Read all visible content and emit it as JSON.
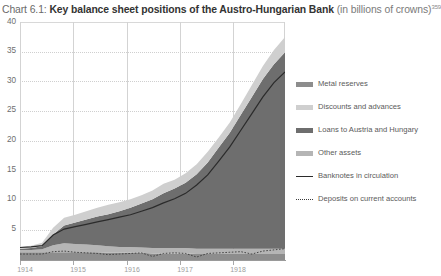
{
  "title": {
    "chart_number": "Chart 6.1:",
    "main": "Key balance sheet positions of the Austro-Hungarian Bank",
    "unit": "(in billions of crowns)",
    "footnote_marker": "359"
  },
  "legend": {
    "position": "right",
    "items": [
      {
        "label": "Metal reserves",
        "style": "area",
        "color": "#8d8d8d"
      },
      {
        "label": "Discounts and advances",
        "style": "area",
        "color": "#cfcfcf"
      },
      {
        "label": "Loans to Austria and Hungary",
        "style": "area",
        "color": "#6e6e6e"
      },
      {
        "label": "Other assets",
        "style": "area",
        "color": "#b5b5b5"
      },
      {
        "label": "Banknotes in circulation",
        "style": "line",
        "color": "#2b2b2b"
      },
      {
        "label": "Deposits on current accounts",
        "style": "dotted",
        "color": "#3a3a3a"
      }
    ]
  },
  "axes": {
    "y_ticks": [
      "5",
      "10",
      "15",
      "20",
      "25",
      "30",
      "35",
      "40"
    ],
    "x_ticks": [
      "1914",
      "1915",
      "1916",
      "1917",
      "1918"
    ]
  },
  "chart_data": {
    "type": "area",
    "title": "Key balance sheet positions of the Austro-Hungarian Bank (in billions of crowns)",
    "xlabel": "",
    "ylabel": "billions of crowns",
    "ylim": [
      0,
      40
    ],
    "grid": true,
    "legend_position": "right",
    "stacked": true,
    "x": [
      "1914",
      "1914.2",
      "1914.4",
      "1914.6",
      "1914.8",
      "1915",
      "1915.2",
      "1915.4",
      "1915.6",
      "1915.8",
      "1916",
      "1916.2",
      "1916.4",
      "1916.6",
      "1916.8",
      "1917",
      "1917.2",
      "1917.4",
      "1917.6",
      "1917.8",
      "1918",
      "1918.2",
      "1918.4",
      "1918.6",
      "1918.8"
    ],
    "x_tick_labels": [
      "1914",
      "1915",
      "1916",
      "1917",
      "1918"
    ],
    "series": [
      {
        "name": "Metal reserves",
        "color": "#8d8d8d",
        "values": [
          1.3,
          1.3,
          1.3,
          1.3,
          1.3,
          1.3,
          1.3,
          1.3,
          1.2,
          1.2,
          1.2,
          1.2,
          1.1,
          1.1,
          1.1,
          1.1,
          1.0,
          1.0,
          1.0,
          1.0,
          1.0,
          1.0,
          1.0,
          1.0,
          1.0
        ]
      },
      {
        "name": "Other assets",
        "color": "#b5b5b5",
        "values": [
          0.4,
          0.4,
          0.5,
          1.2,
          1.5,
          1.4,
          1.3,
          1.2,
          1.1,
          1.0,
          1.0,
          0.9,
          0.9,
          0.9,
          0.9,
          0.9,
          0.9,
          0.9,
          0.9,
          0.9,
          0.9,
          0.9,
          0.9,
          0.9,
          0.9
        ]
      },
      {
        "name": "Loans to Austria and Hungary",
        "color": "#6e6e6e",
        "values": [
          0.2,
          0.3,
          0.5,
          1.8,
          3.0,
          3.6,
          4.2,
          4.8,
          5.4,
          6.0,
          6.6,
          7.4,
          8.2,
          9.2,
          10.0,
          11.0,
          12.5,
          14.5,
          17.0,
          19.5,
          22.5,
          25.5,
          28.5,
          31.0,
          33.0
        ]
      },
      {
        "name": "Discounts and advances",
        "color": "#cfcfcf",
        "values": [
          0.3,
          0.4,
          0.6,
          1.1,
          1.3,
          1.3,
          1.4,
          1.5,
          1.6,
          1.5,
          1.4,
          1.4,
          1.5,
          1.6,
          1.5,
          1.6,
          1.7,
          1.8,
          1.7,
          1.7,
          1.8,
          2.0,
          2.2,
          2.4,
          2.6
        ]
      }
    ],
    "lines": [
      {
        "name": "Banknotes in circulation",
        "color": "#2b2b2b",
        "style": "solid",
        "values": [
          2.1,
          2.2,
          2.4,
          4.2,
          5.2,
          5.6,
          6.0,
          6.4,
          6.8,
          7.2,
          7.6,
          8.2,
          8.8,
          9.6,
          10.3,
          11.2,
          12.6,
          14.3,
          16.6,
          19.0,
          21.8,
          24.6,
          27.4,
          29.8,
          31.6
        ]
      },
      {
        "name": "Deposits on current accounts",
        "color": "#3a3a3a",
        "style": "dotted",
        "values": [
          1.0,
          1.0,
          1.0,
          1.4,
          1.5,
          1.3,
          1.2,
          1.1,
          0.9,
          1.0,
          1.1,
          1.2,
          0.6,
          1.1,
          1.2,
          1.1,
          0.5,
          1.1,
          1.2,
          1.3,
          1.4,
          1.0,
          1.5,
          1.7,
          1.9
        ]
      }
    ]
  }
}
